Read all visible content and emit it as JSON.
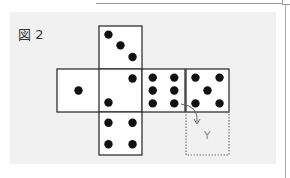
{
  "figure": {
    "label": "図 2",
    "unknown_face_label": "Y",
    "faces": [
      {
        "name": "top",
        "pips": 3
      },
      {
        "name": "left",
        "pips": 1
      },
      {
        "name": "center",
        "pips": 2
      },
      {
        "name": "right-1",
        "pips": 6
      },
      {
        "name": "right-2",
        "pips": 5
      },
      {
        "name": "bottom",
        "pips": 4
      }
    ],
    "colors": {
      "panel": "#f1f1f1",
      "face": "#ffffff",
      "line": "#333333",
      "pip": "#111111",
      "dotted": "#777777"
    }
  }
}
